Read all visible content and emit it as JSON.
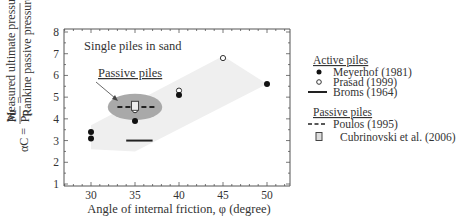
{
  "chart_data": {
    "type": "scatter",
    "title": "",
    "annotation_title": "Single piles in sand",
    "annotation_passive": "Passive piles",
    "xlabel": "Angle of internal friction, φ (degree)",
    "ylabel": {
      "lhs": "αC =",
      "frac1_num": "Pu",
      "frac1_den": "Pp",
      "eq": "=",
      "frac2_num": "Measured ultimate pressure",
      "frac2_den": "Rankine passive pressure"
    },
    "xlim": [
      27,
      53
    ],
    "ylim": [
      1,
      8
    ],
    "xticks": [
      30,
      35,
      40,
      45,
      50
    ],
    "yticks": [
      1,
      2,
      3,
      4,
      5,
      6,
      7,
      8
    ],
    "grid": false,
    "legend_position": "right",
    "legend": {
      "active_heading": "Active piles",
      "passive_heading": "Passive piles",
      "entries": [
        {
          "key": "meyerhof",
          "label": "Meyerhof (1981)",
          "marker": "filled-circle",
          "group": "active"
        },
        {
          "key": "prasad",
          "label": "Prasad (1999)",
          "marker": "open-circle",
          "group": "active"
        },
        {
          "key": "broms",
          "label": "Broms (1964)",
          "marker": "solid-line",
          "group": "active"
        },
        {
          "key": "poulos",
          "label": "Poulos (1995)",
          "marker": "dashed-line",
          "group": "passive"
        },
        {
          "key": "cubrinovski",
          "label": "Cubrinovski et al. (2006)",
          "marker": "open-square",
          "group": "passive"
        }
      ]
    },
    "series": [
      {
        "name": "Meyerhof (1981)",
        "marker": "filled-circle",
        "points": [
          [
            30,
            3.4
          ],
          [
            30,
            3.1
          ],
          [
            35,
            3.9
          ],
          [
            40,
            5.1
          ],
          [
            50,
            5.6
          ]
        ]
      },
      {
        "name": "Prasad (1999)",
        "marker": "open-circle",
        "points": [
          [
            35,
            4.4
          ],
          [
            40,
            5.3
          ],
          [
            45,
            6.8
          ]
        ]
      },
      {
        "name": "Broms (1964)",
        "marker": "solid-line",
        "segment": [
          [
            34,
            3.0
          ],
          [
            37,
            3.0
          ]
        ]
      },
      {
        "name": "Poulos (1995)",
        "marker": "dashed-line",
        "segment": [
          [
            33,
            4.55
          ],
          [
            37.5,
            4.55
          ]
        ]
      },
      {
        "name": "Cubrinovski et al. (2006)",
        "marker": "open-square",
        "points": [
          [
            35,
            4.6
          ]
        ]
      }
    ],
    "regions": [
      {
        "name": "active-band",
        "color": "#efefef",
        "polygon": [
          [
            30,
            3.7
          ],
          [
            45,
            6.9
          ],
          [
            50,
            5.6
          ],
          [
            35,
            2.5
          ],
          [
            30,
            2.6
          ]
        ]
      },
      {
        "name": "passive-ellipse",
        "color": "#a9a9a9",
        "center": [
          35,
          4.55
        ],
        "rx_units": 3.1,
        "ry_units": 0.55
      }
    ]
  }
}
